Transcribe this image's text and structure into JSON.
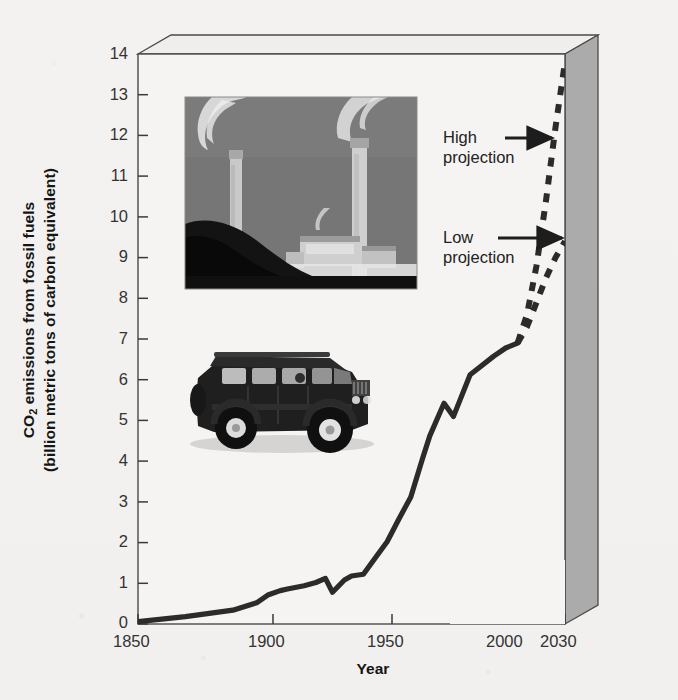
{
  "chart_data": {
    "type": "line",
    "title": "",
    "xlabel": "Year",
    "ylabel": "CO2 emissions from fossil fuels (billion metric tons of carbon equivalent)",
    "ylabel_line1_pre": "CO",
    "ylabel_line1_sub": "2",
    "ylabel_line1_post": " emissions from fossil fuels",
    "ylabel_line2": "(billion metric tons of carbon equivalent)",
    "xlim": [
      1850,
      2030
    ],
    "ylim": [
      0,
      14
    ],
    "grid": false,
    "legend": "none",
    "xticks": [
      1850,
      1900,
      1950,
      2000,
      2030
    ],
    "xtick_labels": [
      "1850",
      "1900",
      "1950",
      "2000",
      "2030"
    ],
    "yticks": [
      0,
      1,
      2,
      3,
      4,
      5,
      6,
      7,
      8,
      9,
      10,
      11,
      12,
      13,
      14
    ],
    "ytick_labels": [
      "0",
      "1",
      "2",
      "3",
      "4",
      "5",
      "6",
      "7",
      "8",
      "9",
      "10",
      "11",
      "12",
      "13",
      "14"
    ],
    "series": [
      {
        "name": "Historical emissions",
        "style": "solid",
        "color": "#2b2b2b",
        "x": [
          1850,
          1860,
          1870,
          1880,
          1890,
          1900,
          1905,
          1910,
          1913,
          1920,
          1925,
          1929,
          1932,
          1937,
          1940,
          1945,
          1950,
          1955,
          1960,
          1965,
          1970,
          1973,
          1979,
          1983,
          1990,
          2000,
          2005,
          2010
        ],
        "values": [
          0.06,
          0.12,
          0.18,
          0.26,
          0.34,
          0.52,
          0.72,
          0.82,
          0.86,
          0.94,
          1.02,
          1.12,
          0.78,
          1.08,
          1.18,
          1.22,
          1.62,
          2.02,
          2.58,
          3.12,
          4.08,
          4.62,
          5.42,
          5.1,
          6.12,
          6.58,
          6.78,
          6.9
        ]
      },
      {
        "name": "High projection",
        "style": "dashed",
        "color": "#2b2b2b",
        "x": [
          2010,
          2014,
          2018,
          2022,
          2026,
          2030
        ],
        "values": [
          6.9,
          7.6,
          8.8,
          10.4,
          12.2,
          13.8
        ]
      },
      {
        "name": "Low projection",
        "style": "dashed",
        "color": "#2b2b2b",
        "x": [
          2010,
          2014,
          2018,
          2022,
          2026,
          2030
        ],
        "values": [
          6.9,
          7.3,
          7.9,
          8.5,
          9.0,
          9.4
        ]
      }
    ],
    "annotations": [
      {
        "name": "high-projection",
        "line1": "High",
        "line2": "projection",
        "target_year": 2024,
        "target_value": 11.4
      },
      {
        "name": "low-projection",
        "line1": "Low",
        "line2": "projection",
        "target_year": 2027,
        "target_value": 9.15
      }
    ],
    "images": [
      {
        "name": "power-plant-photo",
        "caption": "",
        "description": "coal power plant smokestacks"
      },
      {
        "name": "suv-photo",
        "caption": "",
        "description": "sport utility vehicle"
      }
    ],
    "colors": {
      "background": "#f3f2f0",
      "plot_face": "#f5f4f2",
      "wall_right": "#a9a9a9",
      "wall_top": "#efeeec",
      "line": "#2b2b2b",
      "axis": "#3a3a3a",
      "text": "#222222"
    }
  }
}
